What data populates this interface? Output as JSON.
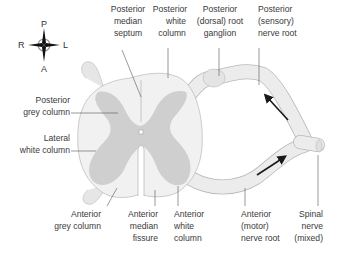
{
  "diagram": {
    "colors": {
      "white_matter": "#f1f1f1",
      "grey_matter": "#cfcfcf",
      "outline": "#b8b8b8",
      "nerve": "#ececec",
      "arrow": "#1a1a1a",
      "text": "#3a3a3a",
      "leader": "#555555"
    },
    "compass": {
      "top": "P",
      "bottom": "A",
      "left": "R",
      "right": "L"
    },
    "labels": {
      "posterior_median_septum": [
        "Posterior",
        "median",
        "septum"
      ],
      "posterior_white_column": [
        "Posterior",
        "white",
        "column"
      ],
      "posterior_root_ganglion": [
        "Posterior",
        "(dorsal) root",
        "ganglion"
      ],
      "posterior_nerve_root": [
        "Posterior",
        "(sensory)",
        "nerve root"
      ],
      "posterior_grey_column": [
        "Posterior",
        "grey column"
      ],
      "lateral_white_column": [
        "Lateral",
        "white column"
      ],
      "anterior_grey_column": [
        "Anterior",
        "grey column"
      ],
      "anterior_median_fissure": [
        "Anterior",
        "median",
        "fissure"
      ],
      "anterior_white_column": [
        "Anterior",
        "white",
        "column"
      ],
      "anterior_nerve_root": [
        "Anterior",
        "(motor)",
        "nerve root"
      ],
      "spinal_nerve": [
        "Spinal",
        "nerve",
        "(mixed)"
      ]
    },
    "arrows": [
      {
        "name": "sensory-direction",
        "direction": "toward spinal cord"
      },
      {
        "name": "motor-direction",
        "direction": "away from spinal cord"
      }
    ]
  }
}
